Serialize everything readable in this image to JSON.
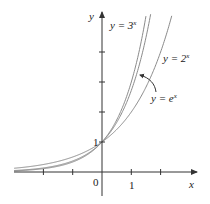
{
  "chart_data": {
    "type": "line",
    "title": "",
    "xlabel": "x",
    "ylabel": "y",
    "x_range": [
      -3,
      3.2
    ],
    "y_range": [
      0,
      5.3
    ],
    "x_ticks": [
      -2,
      -1,
      0,
      1,
      2
    ],
    "y_ticks": [
      1,
      2,
      3,
      4
    ],
    "tick_labels": {
      "origin": "0",
      "x_one": "1",
      "y_one": "1"
    },
    "grid": false,
    "series": [
      {
        "name": "y = 3^x",
        "label_base": "y = 3",
        "label_exp": "x",
        "base": 3
      },
      {
        "name": "y = e^x",
        "label_base": "y = e",
        "label_exp": "x",
        "base": 2.718281828
      },
      {
        "name": "y = 2^x",
        "label_base": "y = 2",
        "label_exp": "x",
        "base": 2
      }
    ],
    "annotations": [
      {
        "text": "y = e^x",
        "type": "arrow-label",
        "points_to": "y = e^x curve"
      }
    ],
    "colors": {
      "curve": "#8a8a8a",
      "axis": "#333333",
      "text": "#222222"
    }
  }
}
